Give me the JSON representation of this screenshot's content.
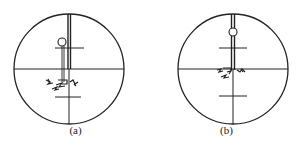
{
  "figure": {
    "stroke_color": "#222222",
    "panels": [
      {
        "id": "a",
        "caption": "(a)",
        "reticle": {
          "cx": 69,
          "cy": 69,
          "r": 55,
          "upper_stadia_y": 48,
          "lower_stadia_y": 97
        },
        "target_rod_x": 69,
        "ring": {
          "cx": 62,
          "cy": 42,
          "r": 4
        },
        "target_image": "offset below crosshair"
      },
      {
        "id": "b",
        "caption": "(b)",
        "reticle": {
          "cx": 82,
          "cy": 69,
          "r": 55,
          "upper_stadia_y": 48,
          "lower_stadia_y": 96
        },
        "target_rod_x": 82,
        "ring": {
          "cx": 82,
          "cy": 32,
          "r": 4
        },
        "target_image": "centered on crosshair"
      }
    ]
  }
}
